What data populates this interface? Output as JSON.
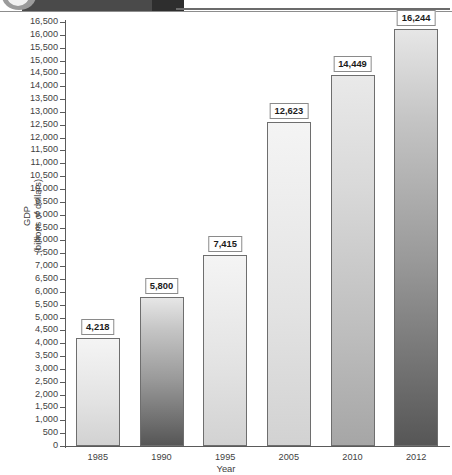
{
  "banner": {
    "exhibit_label": "EXHIBIT 5"
  },
  "chart_data": {
    "type": "bar",
    "title": "",
    "categories": [
      "1985",
      "1990",
      "1995",
      "2005",
      "2010",
      "2012"
    ],
    "values": [
      4218,
      5800,
      7415,
      12623,
      14449,
      16244
    ],
    "value_labels": [
      "4,218",
      "5,800",
      "7,415",
      "12,623",
      "14,449",
      "16,244"
    ],
    "xlabel": "Year",
    "ylabel": "GDP",
    "ylabel_line2": "(billions of dollars)",
    "ylim": [
      0,
      16500
    ],
    "ytick_step": 500,
    "grid": false,
    "legend": false,
    "bar_shades": [
      "light",
      "dark",
      "light",
      "light",
      "mid",
      "dark"
    ],
    "yticks": [
      "16,500",
      "16,000",
      "15,500",
      "15,000",
      "14,500",
      "14,000",
      "13,500",
      "13,000",
      "12,500",
      "12,000",
      "11,500",
      "11,000",
      "10,500",
      "10,000",
      "9,500",
      "9,000",
      "8,500",
      "8,000",
      "7,500",
      "7,000",
      "6,500",
      "6,000",
      "5,500",
      "5,000",
      "4,500",
      "4,000",
      "3,500",
      "3,000",
      "2,500",
      "2,000",
      "1,500",
      "1,000",
      "500",
      "0"
    ]
  }
}
